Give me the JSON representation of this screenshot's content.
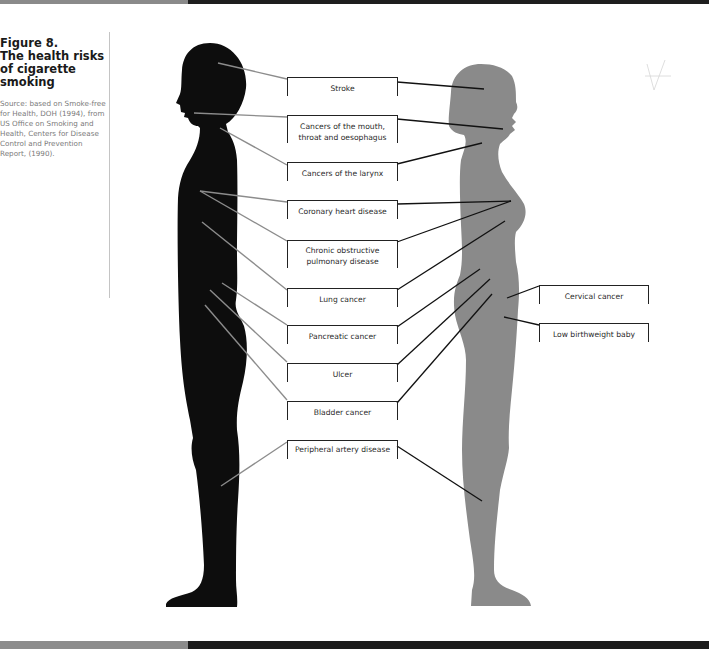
{
  "figure": {
    "number": "Figure 8.",
    "title": "The health risks of cigarette smoking",
    "source": "Source: based on Smoke-free for Health, DOH (1994), from US Office on Smoking and Health, Centers for Disease Control and Prevention Report, (1990)."
  },
  "colors": {
    "male_silhouette": "#0d0d0d",
    "female_silhouette": "#8a8a8a",
    "male_leader": "#8c8c8c",
    "female_leader": "#111111",
    "label_border": "#222222"
  },
  "labels": [
    {
      "id": "stroke",
      "text": "Stroke",
      "both": true
    },
    {
      "id": "mouth",
      "text": "Cancers of the mouth, throat and oesophagus",
      "both": true
    },
    {
      "id": "larynx",
      "text": "Cancers of the larynx",
      "both": true
    },
    {
      "id": "coronary",
      "text": "Coronary heart disease",
      "both": true
    },
    {
      "id": "copd",
      "text": "Chronic obstructive pulmonary disease",
      "both": true
    },
    {
      "id": "lung",
      "text": "Lung cancer",
      "both": true
    },
    {
      "id": "pancreatic",
      "text": "Pancreatic cancer",
      "both": true
    },
    {
      "id": "ulcer",
      "text": "Ulcer",
      "both": true
    },
    {
      "id": "bladder",
      "text": "Bladder cancer",
      "both": true
    },
    {
      "id": "peripheral",
      "text": "Peripheral artery disease",
      "both": true
    },
    {
      "id": "cervical",
      "text": "Cervical cancer",
      "female_only": true
    },
    {
      "id": "birthweight",
      "text": "Low birthweight baby",
      "female_only": true
    }
  ],
  "figures": {
    "male": "male-silhouette",
    "female": "female-silhouette"
  }
}
